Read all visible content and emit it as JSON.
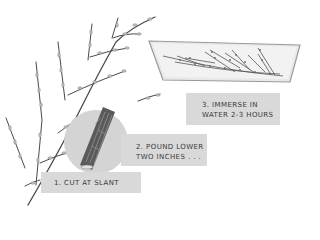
{
  "illustration": {
    "subject": "Pussy willow branch preparation steps",
    "steps": [
      {
        "number": "1.",
        "lines": [
          "1. CUT AT SLANT"
        ]
      },
      {
        "number": "2.",
        "lines": [
          "2. POUND LOWER",
          "TWO INCHES . . ."
        ]
      },
      {
        "number": "3.",
        "lines": [
          "3. IMMERSE IN",
          "WATER 2-3 HOURS"
        ]
      }
    ]
  },
  "colors": {
    "background": "#ffffff",
    "label_bg": "#d9d9d9",
    "label_text": "#3a3a3a",
    "circle": "#d4d4d4",
    "tray": "#e6e6e6",
    "branch": "#4a4a4a"
  }
}
